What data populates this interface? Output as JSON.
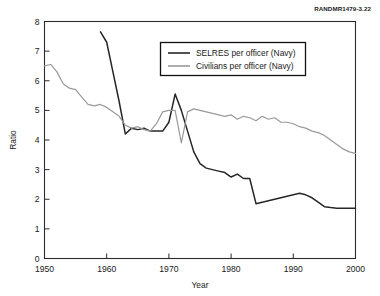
{
  "figure_tag": "RANDMR1479-3.22",
  "chart_data": {
    "type": "line",
    "title": "",
    "xlabel": "Year",
    "ylabel": "Ratio",
    "xlim": [
      1950,
      2000
    ],
    "ylim": [
      0,
      8
    ],
    "xticks": [
      1950,
      1960,
      1970,
      1980,
      1990,
      2000
    ],
    "yticks": [
      0,
      1,
      2,
      3,
      4,
      5,
      6,
      7,
      8
    ],
    "grid": false,
    "legend_position": "top-center",
    "series": [
      {
        "name": "SELRES per officer (Navy)",
        "color": "#262626",
        "width": 1.5,
        "x": [
          1959,
          1960,
          1961,
          1962,
          1963,
          1964,
          1965,
          1966,
          1967,
          1968,
          1969,
          1970,
          1971,
          1972,
          1973,
          1974,
          1975,
          1976,
          1977,
          1978,
          1979,
          1980,
          1981,
          1982,
          1983,
          1984,
          1985,
          1986,
          1987,
          1988,
          1989,
          1990,
          1991,
          1992,
          1993,
          1994,
          1995,
          1996,
          1997,
          1998,
          1999,
          2000
        ],
        "y": [
          7.65,
          7.3,
          6.3,
          5.3,
          4.2,
          4.4,
          4.35,
          4.4,
          4.3,
          4.3,
          4.3,
          4.6,
          5.55,
          5.0,
          4.3,
          3.6,
          3.2,
          3.05,
          3.0,
          2.95,
          2.9,
          2.75,
          2.85,
          2.7,
          2.7,
          1.85,
          1.9,
          1.95,
          2.0,
          2.05,
          2.1,
          2.15,
          2.2,
          2.15,
          2.05,
          1.9,
          1.75,
          1.72,
          1.7,
          1.7,
          1.7,
          1.7
        ]
      },
      {
        "name": "Civilians per officer (Navy)",
        "color": "#9a9a9a",
        "width": 1.2,
        "x": [
          1950,
          1951,
          1952,
          1953,
          1954,
          1955,
          1956,
          1957,
          1958,
          1959,
          1960,
          1961,
          1962,
          1963,
          1964,
          1965,
          1966,
          1967,
          1968,
          1969,
          1970,
          1971,
          1972,
          1973,
          1974,
          1975,
          1976,
          1977,
          1978,
          1979,
          1980,
          1981,
          1982,
          1983,
          1984,
          1985,
          1986,
          1987,
          1988,
          1989,
          1990,
          1991,
          1992,
          1993,
          1994,
          1995,
          1996,
          1997,
          1998,
          1999,
          2000
        ],
        "y": [
          6.5,
          6.55,
          6.3,
          5.9,
          5.75,
          5.7,
          5.45,
          5.2,
          5.15,
          5.2,
          5.1,
          4.95,
          4.8,
          4.5,
          4.4,
          4.45,
          4.35,
          4.3,
          4.55,
          4.95,
          5.0,
          5.0,
          3.9,
          4.95,
          5.05,
          5.0,
          4.95,
          4.9,
          4.85,
          4.8,
          4.85,
          4.7,
          4.8,
          4.75,
          4.65,
          4.8,
          4.7,
          4.75,
          4.6,
          4.6,
          4.55,
          4.45,
          4.4,
          4.3,
          4.25,
          4.15,
          4.0,
          3.85,
          3.7,
          3.6,
          3.55
        ]
      }
    ]
  }
}
